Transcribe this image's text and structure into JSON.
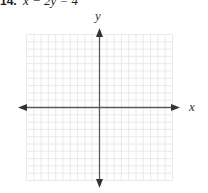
{
  "problem": {
    "number": "14.",
    "equation": "x − 2y = 4"
  },
  "axes": {
    "x_label": "x",
    "y_label": "y"
  },
  "grid": {
    "cells_x": 20,
    "cells_y": 20,
    "range_x": [
      -10,
      10
    ],
    "range_y": [
      -10,
      10
    ],
    "grid_color": "#e4e4e4",
    "axis_color": "#5a5a5a"
  }
}
